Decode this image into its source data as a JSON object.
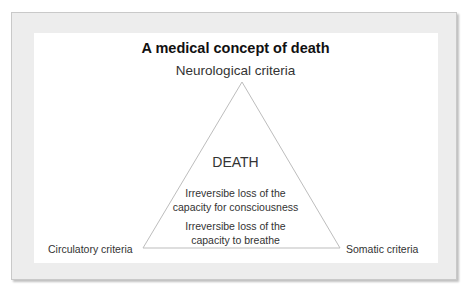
{
  "diagram": {
    "title": "A medical concept of death",
    "apex_label": "Neurological criteria",
    "left_label": "Circulatory criteria",
    "right_label": "Somatic criteria",
    "center_title": "DEATH",
    "center_text_1_a": "Irreversibe loss of the",
    "center_text_1_b": "capacity for consciousness",
    "center_text_2_a": "Irreversibe loss of the",
    "center_text_2_b": "capacity to breathe",
    "shape": "triangle",
    "line_color": "#bbbbbb"
  }
}
